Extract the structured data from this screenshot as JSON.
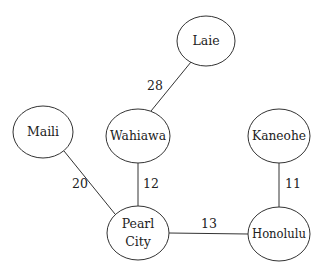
{
  "diagram": {
    "type": "weighted-undirected-graph",
    "nodes": [
      {
        "id": "laie",
        "label": "Laie",
        "cx": 206,
        "cy": 41,
        "rx": 29,
        "ry": 25
      },
      {
        "id": "maili",
        "label": "Maili",
        "cx": 43,
        "cy": 132,
        "rx": 30,
        "ry": 26
      },
      {
        "id": "wahiawa",
        "label": "Wahiawa",
        "cx": 138,
        "cy": 136,
        "rx": 32,
        "ry": 27
      },
      {
        "id": "kaneohe",
        "label": "Kaneohe",
        "cx": 279,
        "cy": 136,
        "rx": 31,
        "ry": 27
      },
      {
        "id": "pearl_city",
        "label_line1": "Pearl",
        "label_line2": "City",
        "cx": 138,
        "cy": 233,
        "rx": 31,
        "ry": 27
      },
      {
        "id": "honolulu",
        "label": "Honolulu",
        "cx": 279,
        "cy": 234,
        "rx": 31,
        "ry": 27
      }
    ],
    "edges": [
      {
        "from": "laie",
        "to": "wahiawa",
        "weight": "28"
      },
      {
        "from": "maili",
        "to": "pearl_city",
        "weight": "20"
      },
      {
        "from": "wahiawa",
        "to": "pearl_city",
        "weight": "12"
      },
      {
        "from": "kaneohe",
        "to": "honolulu",
        "weight": "11"
      },
      {
        "from": "pearl_city",
        "to": "honolulu",
        "weight": "13"
      }
    ]
  }
}
